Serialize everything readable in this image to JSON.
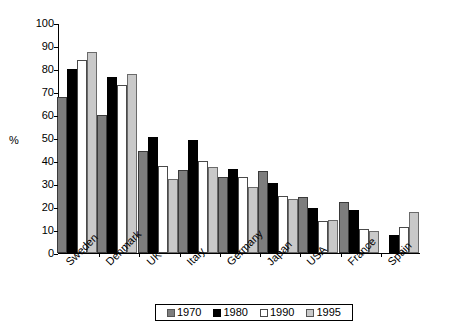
{
  "chart_data": {
    "type": "bar",
    "title": "",
    "xlabel": "",
    "ylabel": "%",
    "ylim": [
      0,
      100
    ],
    "ytick_step": 10,
    "yticks": [
      0,
      10,
      20,
      30,
      40,
      50,
      60,
      70,
      80,
      90,
      100
    ],
    "grid": false,
    "legend_position": "bottom",
    "categories": [
      "Sweden",
      "Denmark",
      "UK",
      "Italy",
      "Germany",
      "Japan",
      "USA",
      "France",
      "Spain"
    ],
    "series": [
      {
        "name": "1970",
        "color": "#7d7d7d",
        "values": [
          68,
          60,
          44.5,
          36,
          33,
          35.5,
          24.5,
          22,
          null
        ]
      },
      {
        "name": "1980",
        "color": "#000000",
        "values": [
          80,
          76.5,
          50.5,
          49,
          36.5,
          30.5,
          19.5,
          18.5,
          8
        ]
      },
      {
        "name": "1990",
        "color": "#ffffff",
        "values": [
          84,
          73,
          38,
          40,
          33,
          25,
          14,
          10.5,
          11.5
        ]
      },
      {
        "name": "1995",
        "color": "#c9c9c9",
        "values": [
          87.5,
          78,
          32,
          37.5,
          28.5,
          23.5,
          14.5,
          9.5,
          18
        ]
      }
    ]
  },
  "axis": {
    "y_label": "%"
  },
  "legend": {
    "items": [
      {
        "label": "1970",
        "color": "#7d7d7d"
      },
      {
        "label": "1980",
        "color": "#000000"
      },
      {
        "label": "1990",
        "color": "#ffffff"
      },
      {
        "label": "1995",
        "color": "#c9c9c9"
      }
    ]
  }
}
